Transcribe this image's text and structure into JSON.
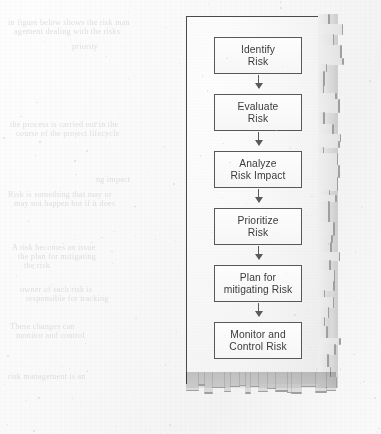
{
  "document": {
    "media": "scanned-book-page",
    "background_color": "#fcfcfc",
    "overlay": {
      "name": "torn-paper-scrap",
      "border_color": "#4a4a4a",
      "paper_color": "#f7f7f7",
      "shadow_color": "#9f9f9f",
      "torn_edges": [
        "right",
        "bottom"
      ]
    }
  },
  "flowchart": {
    "type": "vertical-process-flow",
    "title": "Risk Management Process",
    "node_count": 6,
    "connector": "downward-arrow",
    "node_border_color": "#585858",
    "node_fill_color": "#f9f9f9",
    "nodes": [
      {
        "id": "identify-risk",
        "lines": [
          "Identify",
          "Risk"
        ]
      },
      {
        "id": "evaluate-risk",
        "lines": [
          "Evaluate",
          "Risk"
        ]
      },
      {
        "id": "analyze-risk-impact",
        "lines": [
          "Analyze",
          "Risk Impact"
        ]
      },
      {
        "id": "prioritize-risk",
        "lines": [
          "Prioritize",
          "Risk"
        ]
      },
      {
        "id": "plan-mitigating-risk",
        "lines": [
          "Plan for",
          "mitigating Risk"
        ]
      },
      {
        "id": "monitor-control-risk",
        "lines": [
          "Monitor and",
          "Control Risk"
        ]
      }
    ]
  },
  "background_text": {
    "legible": false,
    "description": "faint illegible bleed-through text from reverse of page",
    "lines": [
      {
        "top": 18,
        "left": 8,
        "text": "in figure below shows the risk man"
      },
      {
        "top": 27,
        "left": 14,
        "text": "agement dealing with the risks"
      },
      {
        "top": 42,
        "left": 72,
        "text": "priority"
      },
      {
        "top": 120,
        "left": 10,
        "text": "the process is carried out in the"
      },
      {
        "top": 129,
        "left": 16,
        "text": "course of the project lifecycle"
      },
      {
        "top": 175,
        "left": 96,
        "text": "ng impact"
      },
      {
        "top": 190,
        "left": 8,
        "text": "Risk is something that may or"
      },
      {
        "top": 199,
        "left": 14,
        "text": "may not happen but if it does"
      },
      {
        "top": 243,
        "left": 12,
        "text": "A risk becomes an issue"
      },
      {
        "top": 252,
        "left": 18,
        "text": "the plan for mitigating"
      },
      {
        "top": 261,
        "left": 24,
        "text": "the risk"
      },
      {
        "top": 285,
        "left": 20,
        "text": "owner of each risk is"
      },
      {
        "top": 294,
        "left": 26,
        "text": "responsible for tracking"
      },
      {
        "top": 322,
        "left": 10,
        "text": "These changes can"
      },
      {
        "top": 331,
        "left": 16,
        "text": "monitor and control"
      },
      {
        "top": 372,
        "left": 8,
        "text": "risk management is an"
      }
    ]
  }
}
